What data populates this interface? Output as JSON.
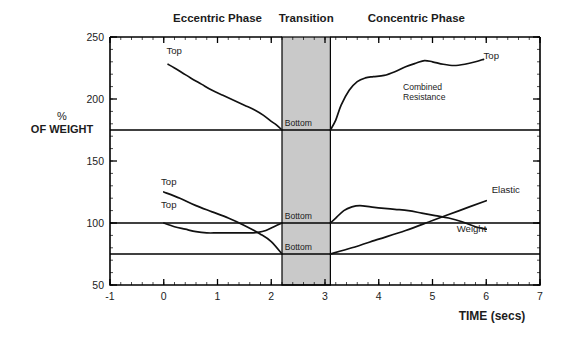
{
  "chart_data": {
    "type": "line",
    "title": "",
    "xlabel": "TIME (secs)",
    "ylabel": "% OF WEIGHT",
    "ylabel_line1": "%",
    "ylabel_line2": "OF WEIGHT",
    "xlim": [
      -1,
      7
    ],
    "ylim": [
      50,
      250
    ],
    "xticks": [
      -1,
      0,
      1,
      2,
      3,
      4,
      5,
      6,
      7
    ],
    "xtick_labels": [
      "-1",
      "0",
      "1",
      "2",
      "3",
      "4",
      "5",
      "6",
      "7"
    ],
    "yticks": [
      50,
      100,
      150,
      200,
      250
    ],
    "ytick_labels": [
      "50",
      "100",
      "150",
      "200",
      "250"
    ],
    "grid": false,
    "legend_position": "inline-annotations",
    "phase_labels": [
      {
        "text": "Eccentric Phase",
        "x_center": 1.0
      },
      {
        "text": "Transition",
        "x_center": 2.65
      },
      {
        "text": "Concentric Phase",
        "x_center": 4.7
      }
    ],
    "shaded_region": {
      "name": "Transition",
      "x_start": 2.2,
      "x_end": 3.1,
      "color": "#c9c9c9"
    },
    "reference_lines": [
      {
        "name": "combined-resistance-reference",
        "y": 175
      },
      {
        "name": "weight-reference",
        "y": 100
      },
      {
        "name": "elastic-reference",
        "y": 75
      }
    ],
    "annotations": [
      {
        "text": "Top",
        "x": 0.05,
        "y": 236,
        "name": "top-label-combined-eccentric"
      },
      {
        "text": "Top",
        "x": 5.95,
        "y": 232,
        "name": "top-label-combined-concentric"
      },
      {
        "text": "Combined Resistance",
        "line1": "Combined",
        "line2": "Resistance",
        "x": 4.45,
        "y": 207,
        "name": "combined-resistance-label"
      },
      {
        "text": "Bottom",
        "x": 2.25,
        "y": 178,
        "name": "bottom-label-combined"
      },
      {
        "text": "Top",
        "x": -0.05,
        "y": 131,
        "name": "top-label-elastic-eccentric"
      },
      {
        "text": "Top",
        "x": -0.05,
        "y": 112,
        "name": "top-label-weight-eccentric"
      },
      {
        "text": "Bottom",
        "x": 2.25,
        "y": 103,
        "name": "bottom-label-weight"
      },
      {
        "text": "Bottom",
        "x": 2.25,
        "y": 78,
        "name": "bottom-label-elastic"
      },
      {
        "text": "Elastic",
        "x": 6.1,
        "y": 124,
        "name": "elastic-label"
      },
      {
        "text": "Weight",
        "x": 5.45,
        "y": 93,
        "name": "weight-label"
      }
    ],
    "series": [
      {
        "name": "Combined Resistance (eccentric)",
        "points": [
          [
            0.08,
            228
          ],
          [
            0.2,
            225
          ],
          [
            0.35,
            221
          ],
          [
            0.5,
            217
          ],
          [
            0.7,
            212
          ],
          [
            0.9,
            207
          ],
          [
            1.1,
            203
          ],
          [
            1.3,
            199
          ],
          [
            1.5,
            195
          ],
          [
            1.7,
            191
          ],
          [
            1.85,
            187
          ],
          [
            2.0,
            182
          ],
          [
            2.1,
            179
          ],
          [
            2.2,
            175
          ]
        ]
      },
      {
        "name": "Combined Resistance (concentric)",
        "points": [
          [
            3.1,
            175
          ],
          [
            3.2,
            183
          ],
          [
            3.3,
            195
          ],
          [
            3.45,
            207
          ],
          [
            3.6,
            214
          ],
          [
            3.75,
            217
          ],
          [
            3.9,
            218
          ],
          [
            4.1,
            219
          ],
          [
            4.3,
            222
          ],
          [
            4.5,
            226
          ],
          [
            4.7,
            229
          ],
          [
            4.85,
            231
          ],
          [
            5.0,
            230
          ],
          [
            5.2,
            228
          ],
          [
            5.4,
            227
          ],
          [
            5.6,
            228
          ],
          [
            5.8,
            230
          ],
          [
            5.95,
            232
          ]
        ]
      },
      {
        "name": "Elastic (eccentric)",
        "points": [
          [
            0.0,
            125
          ],
          [
            0.3,
            120
          ],
          [
            0.6,
            114
          ],
          [
            0.9,
            109
          ],
          [
            1.2,
            104
          ],
          [
            1.5,
            98
          ],
          [
            1.8,
            91
          ],
          [
            2.0,
            85
          ],
          [
            2.2,
            75
          ]
        ]
      },
      {
        "name": "Weight (eccentric)",
        "points": [
          [
            0.0,
            100
          ],
          [
            0.2,
            97
          ],
          [
            0.4,
            95
          ],
          [
            0.6,
            93
          ],
          [
            0.8,
            92
          ],
          [
            1.0,
            92
          ],
          [
            1.2,
            92
          ],
          [
            1.4,
            92
          ],
          [
            1.6,
            92
          ],
          [
            1.75,
            92.5
          ],
          [
            1.9,
            94
          ],
          [
            2.05,
            97
          ],
          [
            2.2,
            100
          ]
        ]
      },
      {
        "name": "Weight (concentric)",
        "points": [
          [
            3.1,
            100
          ],
          [
            3.2,
            104
          ],
          [
            3.35,
            110
          ],
          [
            3.5,
            113
          ],
          [
            3.65,
            114
          ],
          [
            3.85,
            113
          ],
          [
            4.05,
            112
          ],
          [
            4.3,
            111
          ],
          [
            4.55,
            110
          ],
          [
            4.8,
            108
          ],
          [
            5.05,
            106
          ],
          [
            5.3,
            104
          ],
          [
            5.55,
            101
          ],
          [
            5.8,
            97
          ],
          [
            6.0,
            95
          ]
        ]
      },
      {
        "name": "Elastic (concentric)",
        "points": [
          [
            3.1,
            75
          ],
          [
            3.5,
            80
          ],
          [
            4.0,
            87
          ],
          [
            4.5,
            94
          ],
          [
            5.0,
            102
          ],
          [
            5.5,
            110
          ],
          [
            6.0,
            118
          ]
        ]
      }
    ]
  }
}
